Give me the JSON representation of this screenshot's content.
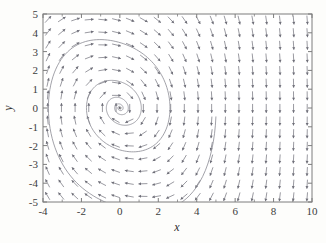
{
  "figure": {
    "name": "phase-portrait",
    "background_color": "#fdfdfb",
    "frame_color": "#7d7d7d",
    "arrow_color": "#6e6e78",
    "trajectory_color": "#8a8a93",
    "text_color": "#3c3c3c"
  },
  "chart_data": {
    "type": "scatter",
    "title": "",
    "subtitle": "",
    "xlabel": "x",
    "ylabel": "y",
    "xlim": [
      -4,
      10
    ],
    "ylim": [
      -5,
      5
    ],
    "grid": false,
    "legend": null,
    "plot_kind": "vector-field-with-trajectory",
    "xticks": [
      -4,
      -2,
      0,
      2,
      4,
      6,
      8,
      10
    ],
    "xtick_labels": [
      "-4",
      "-2",
      "0",
      "2",
      "4",
      "6",
      "8",
      "10"
    ],
    "yticks": [
      -5,
      -4,
      -3,
      -2,
      -1,
      0,
      1,
      2,
      3,
      4,
      5
    ],
    "ytick_labels": [
      "-5",
      "-4",
      "-3",
      "-2",
      "-1",
      "0",
      "1",
      "2",
      "3",
      "4",
      "5"
    ],
    "xminorticks": [
      -3,
      -1,
      1,
      3,
      5,
      7,
      9
    ],
    "vector_field": {
      "description": "Direction field of a damped nonlinear oscillator; arrows drawn on a uniform grid and normalized to equal length.",
      "grid_nx": 20,
      "grid_ny": 15,
      "grid_x_start": -3.75,
      "grid_x_end": 9.75,
      "grid_y_start": -4.7,
      "grid_y_end": 4.7,
      "arrow_length_px": 9,
      "equations": {
        "dx_dt": "y",
        "dy_dt": "-0.30*y - x*(1 + 0.055*x*x)"
      },
      "damping": 0.3,
      "stiffness_cubic_coeff": 0.055
    },
    "trajectory": {
      "description": "Single solution curve spiralling clockwise inward to the stable focus at the origin.",
      "equilibrium": [
        0,
        0
      ],
      "equilibrium_type": "stable spiral (focus)",
      "start_point": [
        5.0,
        -0.45
      ],
      "end_point": [
        0,
        0
      ],
      "direction": "clockwise",
      "t_start": 0,
      "t_end": 46,
      "dt": 0.01,
      "turns_visible": 4,
      "extremes": {
        "leftmost_x": -3.6,
        "rightmost_x": 5.0,
        "lowest_y": -4.35,
        "highest_y": 3.15
      }
    }
  },
  "axis_labels": {
    "x_title": "x",
    "y_title": "y"
  }
}
